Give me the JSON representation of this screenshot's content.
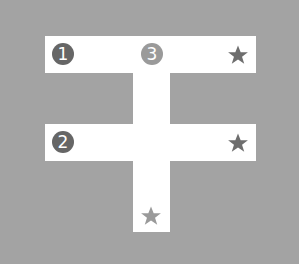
{
  "colors": {
    "background": "#a3a3a3",
    "path": "#ffffff",
    "dark_marker": "#666666",
    "light_marker": "#999999",
    "dark_star": "#6e6e6e",
    "light_star": "#9a9a9a"
  },
  "diagram": {
    "paths": [
      {
        "name": "top-bar",
        "x": 45,
        "y": 36,
        "w": 211,
        "h": 37
      },
      {
        "name": "middle-bar",
        "x": 45,
        "y": 124,
        "w": 211,
        "h": 37
      },
      {
        "name": "vertical-stem",
        "x": 133,
        "y": 36,
        "w": 37,
        "h": 196
      }
    ],
    "markers": [
      {
        "label": "1",
        "x": 63,
        "y": 54,
        "shade": "dark"
      },
      {
        "label": "2",
        "x": 63,
        "y": 142,
        "shade": "dark"
      },
      {
        "label": "3",
        "x": 152,
        "y": 54,
        "shade": "light"
      }
    ],
    "stars": [
      {
        "x": 238,
        "y": 55,
        "shade": "dark"
      },
      {
        "x": 238,
        "y": 143,
        "shade": "dark"
      },
      {
        "x": 151,
        "y": 216,
        "shade": "light"
      }
    ]
  }
}
